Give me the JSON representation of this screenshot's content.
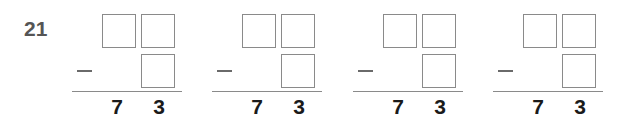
{
  "exercise": {
    "number": "21",
    "operator": "−",
    "problems": [
      {
        "minuend": {
          "tens": "",
          "ones": ""
        },
        "subtrahend": {
          "ones": ""
        },
        "difference": {
          "tens": "7",
          "ones": "3"
        }
      },
      {
        "minuend": {
          "tens": "",
          "ones": ""
        },
        "subtrahend": {
          "ones": ""
        },
        "difference": {
          "tens": "7",
          "ones": "3"
        }
      },
      {
        "minuend": {
          "tens": "",
          "ones": ""
        },
        "subtrahend": {
          "ones": ""
        },
        "difference": {
          "tens": "7",
          "ones": "3"
        }
      },
      {
        "minuend": {
          "tens": "",
          "ones": ""
        },
        "subtrahend": {
          "ones": ""
        },
        "difference": {
          "tens": "7",
          "ones": "3"
        }
      }
    ]
  },
  "colors": {
    "number_label": "#555555",
    "box_border": "#8a8a8a",
    "digits": "#1a1a1a"
  }
}
